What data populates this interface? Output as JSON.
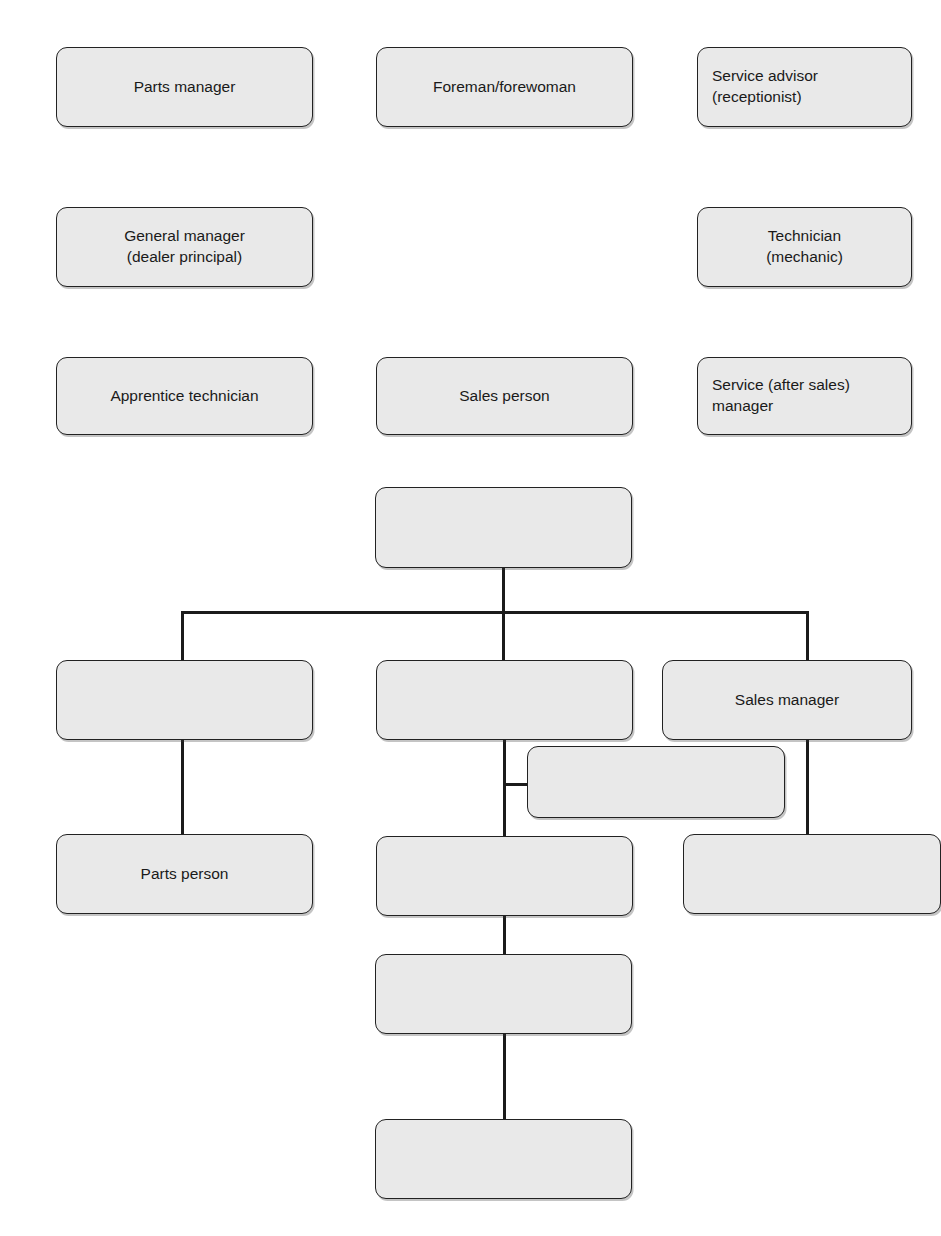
{
  "page": {
    "top_caption": "",
    "background": "#ffffff",
    "box_fill": "#e9e9e9",
    "box_border": "#222222",
    "line_color": "#1b1b1b",
    "text_color": "#1a1a1a"
  },
  "word_bank": {
    "description": "Loose labelled role boxes arranged in three rows above the chart",
    "rows": [
      {
        "row": 1,
        "boxes": [
          {
            "id": "parts-manager",
            "label": "Parts manager"
          },
          {
            "id": "foreman-forewoman",
            "label": "Foreman/forewoman"
          },
          {
            "id": "service-advisor",
            "label": "Service advisor\n(receptionist)"
          }
        ]
      },
      {
        "row": 2,
        "boxes": [
          {
            "id": "general-manager",
            "label": "General manager\n(dealer principal)"
          },
          {
            "id": "technician",
            "label": "Technician\n(mechanic)"
          }
        ]
      },
      {
        "row": 3,
        "boxes": [
          {
            "id": "apprentice-technician",
            "label": "Apprentice technician"
          },
          {
            "id": "sales-person",
            "label": "Sales person"
          },
          {
            "id": "service-after-sales-manager",
            "label": "Service (after sales)\nmanager"
          }
        ]
      }
    ]
  },
  "org_chart": {
    "description": "Hierarchy tree with mostly blank boxes to be completed",
    "nodes": [
      {
        "id": "root",
        "level": 0,
        "label": "",
        "blank": true
      },
      {
        "id": "branch-left",
        "level": 1,
        "label": "",
        "blank": true
      },
      {
        "id": "branch-middle",
        "level": 1,
        "label": "",
        "blank": true
      },
      {
        "id": "branch-right",
        "level": 1,
        "label": "Sales manager",
        "blank": false
      },
      {
        "id": "offset-node",
        "level": 2,
        "label": "",
        "blank": true
      },
      {
        "id": "left-child",
        "level": 2,
        "label": "Parts person",
        "blank": false
      },
      {
        "id": "middle-child",
        "level": 2,
        "label": "",
        "blank": true
      },
      {
        "id": "right-child",
        "level": 2,
        "label": "",
        "blank": true
      },
      {
        "id": "middle-grandchild",
        "level": 3,
        "label": "",
        "blank": true
      },
      {
        "id": "middle-great-grandchild",
        "level": 4,
        "label": "",
        "blank": true
      }
    ]
  }
}
